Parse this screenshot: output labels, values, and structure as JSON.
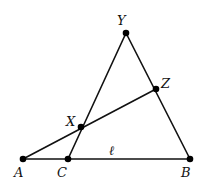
{
  "diagram": {
    "type": "geometry",
    "colors": {
      "stroke": "#111111",
      "point": "#000000",
      "background": "#ffffff"
    },
    "points": [
      {
        "id": "Y",
        "label": "Y",
        "x": 126,
        "y": 33,
        "lx": 117,
        "ly": 25
      },
      {
        "id": "Z",
        "label": "Z",
        "x": 156,
        "y": 89,
        "lx": 161,
        "ly": 88
      },
      {
        "id": "X",
        "label": "X",
        "x": 81,
        "y": 127,
        "lx": 66,
        "ly": 126
      },
      {
        "id": "A",
        "label": "A",
        "x": 23,
        "y": 159,
        "lx": 14,
        "ly": 177
      },
      {
        "id": "C",
        "label": "C",
        "x": 68,
        "y": 159,
        "lx": 57,
        "ly": 177
      },
      {
        "id": "B",
        "label": "B",
        "x": 190,
        "y": 159,
        "lx": 181,
        "ly": 177
      }
    ],
    "segments": [
      {
        "from": "A",
        "to": "B",
        "name": "line-l"
      },
      {
        "from": "C",
        "to": "Y",
        "name": "segment-CY"
      },
      {
        "from": "Y",
        "to": "B",
        "name": "segment-YB"
      },
      {
        "from": "A",
        "to": "Z",
        "name": "segment-AZ"
      }
    ],
    "line_label": {
      "text": "ℓ",
      "x": 109,
      "y": 155
    }
  }
}
